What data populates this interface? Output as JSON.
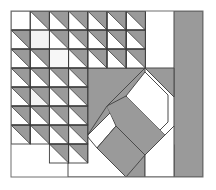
{
  "figure": {
    "type": "geometric-quilt-block",
    "canvas": {
      "width": 216,
      "height": 190
    },
    "background_color": "#ffffff"
  },
  "palette": {
    "background": "#ffffff",
    "shade_gray": "#9a9a9a",
    "shade_gray_light": "#a8a8a8",
    "outline": "#3b3b3b",
    "outline_light": "#6f6f6f",
    "patch_white": "#ffffff",
    "patch_offwhite": "#f2f2f2"
  },
  "block": {
    "name": "quilt-block-frame",
    "x": 11,
    "y": 11,
    "width": 192,
    "height": 166,
    "stroke": "#6f6f6f",
    "stroke_width": 1,
    "fill": "#ffffff"
  },
  "grid": {
    "name": "half-square-triangle-grid",
    "origin_x": 11,
    "origin_y": 11,
    "cell_width": 19.2,
    "cell_height": 19.0,
    "columns": 7,
    "rows": 8,
    "triangle_orientation": "upper-right-to-lower-left hypotenuse, shaded upper-right",
    "note": "staircase arrangement: shaded half-square triangles fill a descending diagonal field"
  },
  "hst_cells": [
    {
      "col": 1,
      "row": 0
    },
    {
      "col": 2,
      "row": 0
    },
    {
      "col": 3,
      "row": 0
    },
    {
      "col": 4,
      "row": 0
    },
    {
      "col": 5,
      "row": 0
    },
    {
      "col": 6,
      "row": 0
    },
    {
      "col": 0,
      "row": 1
    },
    {
      "col": 2,
      "row": 1
    },
    {
      "col": 3,
      "row": 1
    },
    {
      "col": 4,
      "row": 1
    },
    {
      "col": 5,
      "row": 1
    },
    {
      "col": 6,
      "row": 1
    },
    {
      "col": 0,
      "row": 2
    },
    {
      "col": 1,
      "row": 2
    },
    {
      "col": 3,
      "row": 2
    },
    {
      "col": 4,
      "row": 2
    },
    {
      "col": 5,
      "row": 2
    },
    {
      "col": 6,
      "row": 2
    },
    {
      "col": 0,
      "row": 3
    },
    {
      "col": 1,
      "row": 3
    },
    {
      "col": 2,
      "row": 3
    },
    {
      "col": 3,
      "row": 3
    },
    {
      "col": 0,
      "row": 4
    },
    {
      "col": 1,
      "row": 4
    },
    {
      "col": 2,
      "row": 4
    },
    {
      "col": 3,
      "row": 4
    },
    {
      "col": 0,
      "row": 5
    },
    {
      "col": 1,
      "row": 5
    },
    {
      "col": 2,
      "row": 5
    },
    {
      "col": 3,
      "row": 5
    },
    {
      "col": 0,
      "row": 6
    },
    {
      "col": 1,
      "row": 6
    },
    {
      "col": 2,
      "row": 6
    },
    {
      "col": 3,
      "row": 6
    },
    {
      "col": 2,
      "row": 7
    },
    {
      "col": 3,
      "row": 7
    }
  ],
  "empty_cells": [
    {
      "col": 0,
      "row": 0,
      "fill": "#ffffff"
    },
    {
      "col": 1,
      "row": 1,
      "fill": "#f2f2f2"
    },
    {
      "col": 2,
      "row": 2,
      "fill": "#f7f7f7"
    },
    {
      "col": 1,
      "row": 4,
      "fill": "#f4f4f4"
    }
  ],
  "shapes": [
    {
      "name": "center-large-chevron",
      "kind": "polygon",
      "fill": "#9a9a9a",
      "points": "87,68 145,68 145,97 116,126 87,97"
    },
    {
      "name": "lower-left-shaded-wedge",
      "kind": "polygon",
      "fill": "#9a9a9a",
      "points": "87,68 87,136 68,155 68,87"
    },
    {
      "name": "diagonal-sash-band",
      "kind": "polygon",
      "fill": "#9a9a9a",
      "points": "116,126 145,97 174,126 145,155"
    },
    {
      "name": "lower-diagonal-tail",
      "kind": "polygon",
      "fill": "#9a9a9a",
      "points": "116,126 145,155 145,177 126,177 97,148"
    },
    {
      "name": "right-vertical-bar",
      "kind": "rect",
      "fill": "#9a9a9a",
      "x": 174,
      "y": 11,
      "width": 29,
      "height": 166
    },
    {
      "name": "right-upper-triangle-accent",
      "kind": "polygon",
      "fill": "#9a9a9a",
      "points": "145,68 174,68 174,97"
    },
    {
      "name": "center-white-octagon",
      "kind": "polygon",
      "fill": "#ffffff",
      "points": "145,68 174,97 174,126 145,97 116,126 145,97"
    }
  ],
  "outlines": [
    {
      "name": "hst-grid-outline",
      "stroke": "#3b3b3b",
      "width": 1
    },
    {
      "name": "shape-outline",
      "stroke": "#4a4a4a",
      "width": 1
    }
  ],
  "legend": {
    "shaded_label": "shaded fabric",
    "light_label": "light fabric"
  }
}
